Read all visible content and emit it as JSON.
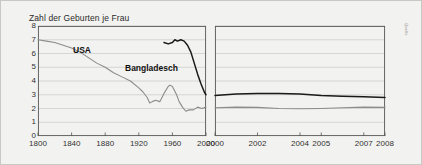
{
  "figure": {
    "title": "Zahl der Geburten je Frau",
    "source_credit": "Quelle",
    "background_color": "#f2f2f0",
    "border_color": "#c8c8c4"
  },
  "series_labels": {
    "usa": "USA",
    "bangladesch": "Bangladesch"
  },
  "colors": {
    "usa_line": "#8c8c8c",
    "bangladesch_line": "#1a1a1a",
    "grid": "#c9c9c5",
    "axis": "#555555"
  },
  "chart_data": {
    "type": "line",
    "title": "Zahl der Geburten je Frau",
    "xlabel": "",
    "ylabel": "Zahl der Geburten je Frau",
    "grid": true,
    "legend_position": "inline-annotations",
    "panels": [
      {
        "name": "left-panel-historic",
        "xlim": [
          1800,
          2000
        ],
        "ylim": [
          0,
          8
        ],
        "xticks": [
          1800,
          1840,
          1880,
          1920,
          1960,
          2000
        ],
        "yticks": [
          0,
          1,
          2,
          3,
          4,
          5,
          6,
          7,
          8
        ],
        "series": [
          {
            "name": "USA",
            "color": "#8c8c8c",
            "x": [
              1800,
              1810,
              1820,
              1830,
              1840,
              1850,
              1860,
              1870,
              1880,
              1890,
              1900,
              1910,
              1920,
              1925,
              1930,
              1933,
              1936,
              1940,
              1945,
              1950,
              1955,
              1957,
              1960,
              1965,
              1968,
              1972,
              1976,
              1980,
              1985,
              1990,
              1995,
              2000
            ],
            "values": [
              7.0,
              6.9,
              6.8,
              6.6,
              6.4,
              6.1,
              5.7,
              5.3,
              5.0,
              4.6,
              4.3,
              4.0,
              3.5,
              3.2,
              2.8,
              2.4,
              2.5,
              2.6,
              2.5,
              3.1,
              3.6,
              3.7,
              3.6,
              3.0,
              2.5,
              2.1,
              1.8,
              1.9,
              1.9,
              2.1,
              2.0,
              2.1
            ]
          },
          {
            "name": "Bangladesch",
            "color": "#1a1a1a",
            "x": [
              1950,
              1955,
              1960,
              1963,
              1966,
              1970,
              1974,
              1978,
              1982,
              1986,
              1990,
              1994,
              1998,
              2000
            ],
            "values": [
              6.8,
              6.7,
              6.8,
              7.0,
              6.9,
              7.0,
              6.9,
              6.6,
              6.1,
              5.3,
              4.5,
              3.8,
              3.2,
              3.0
            ]
          }
        ]
      },
      {
        "name": "right-panel-recent",
        "xlim": [
          2000,
          2008
        ],
        "ylim": [
          0,
          8
        ],
        "xticks": [
          2000,
          2002,
          2004,
          2005,
          2007,
          2008
        ],
        "yticks": [
          0,
          1,
          2,
          3,
          4,
          5,
          6,
          7,
          8
        ],
        "series": [
          {
            "name": "Bangladesch",
            "color": "#1a1a1a",
            "x": [
              2000,
              2001,
              2002,
              2003,
              2004,
              2005,
              2006,
              2007,
              2008
            ],
            "values": [
              2.95,
              3.05,
              3.1,
              3.1,
              3.05,
              2.95,
              2.9,
              2.85,
              2.8
            ]
          },
          {
            "name": "USA",
            "color": "#8c8c8c",
            "x": [
              2000,
              2001,
              2002,
              2003,
              2004,
              2005,
              2006,
              2007,
              2008
            ],
            "values": [
              2.05,
              2.1,
              2.08,
              2.0,
              1.98,
              2.0,
              2.05,
              2.1,
              2.08
            ]
          }
        ]
      }
    ]
  }
}
